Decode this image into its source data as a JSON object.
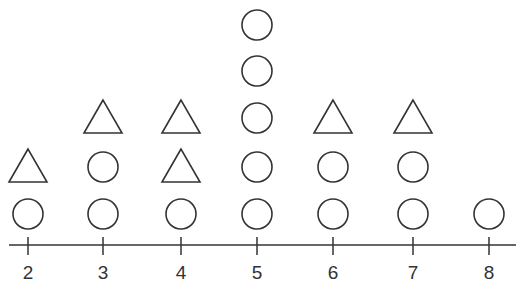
{
  "chart_data": {
    "type": "dot-plot",
    "title": "",
    "xlabel": "",
    "ylabel": "",
    "axis": {
      "min": 2,
      "max": 8,
      "ticks": [
        2,
        3,
        4,
        5,
        6,
        7,
        8
      ]
    },
    "legend": [],
    "columns": [
      {
        "x": 2,
        "marks": [
          "circle",
          "triangle"
        ]
      },
      {
        "x": 3,
        "marks": [
          "circle",
          "circle",
          "triangle"
        ]
      },
      {
        "x": 4,
        "marks": [
          "circle",
          "triangle",
          "triangle"
        ]
      },
      {
        "x": 5,
        "marks": [
          "circle",
          "circle",
          "circle",
          "circle",
          "circle"
        ]
      },
      {
        "x": 6,
        "marks": [
          "circle",
          "circle",
          "triangle"
        ]
      },
      {
        "x": 7,
        "marks": [
          "circle",
          "circle",
          "triangle"
        ]
      },
      {
        "x": 8,
        "marks": [
          "circle"
        ]
      }
    ],
    "series": [
      {
        "name": "circle",
        "values": [
          1,
          2,
          1,
          5,
          2,
          2,
          1
        ]
      },
      {
        "name": "triangle",
        "values": [
          1,
          1,
          2,
          0,
          1,
          1,
          0
        ]
      }
    ],
    "categories": [
      "2",
      "3",
      "4",
      "5",
      "6",
      "7",
      "8"
    ],
    "colors": {
      "stroke": "#333333",
      "background": "#ffffff"
    }
  },
  "axis_labels": [
    "2",
    "3",
    "4",
    "5",
    "6",
    "7",
    "8"
  ]
}
